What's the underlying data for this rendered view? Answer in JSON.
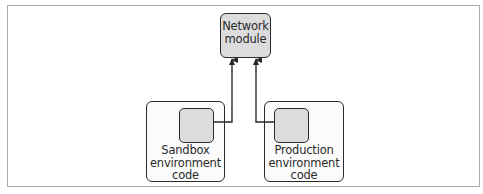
{
  "diagram": {
    "nodes": [
      {
        "id": "network",
        "label_line1": "Network",
        "label_line2": "module"
      },
      {
        "id": "sandbox",
        "label_line1": "Sandbox",
        "label_line2": "environment",
        "label_line3": "code"
      },
      {
        "id": "production",
        "label_line1": "Production",
        "label_line2": "environment",
        "label_line3": "code"
      }
    ],
    "edges": [
      {
        "from": "sandbox",
        "to": "network"
      },
      {
        "from": "production",
        "to": "network"
      }
    ],
    "colors": {
      "stroke": "#2a2a2a",
      "module_fill": "#dcdcdc",
      "container_fill": "#fbfbfb",
      "frame": "#a9a9a9"
    }
  }
}
